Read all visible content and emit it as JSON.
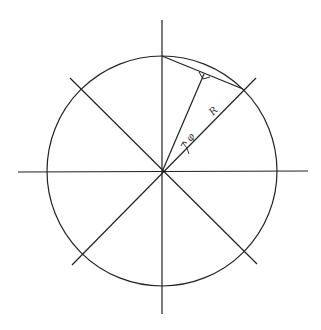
{
  "diagram": {
    "labels": {
      "radius": "R",
      "angle": "φ"
    },
    "colors": {
      "stroke": "#222222",
      "background": "#ffffff"
    },
    "geometry": {
      "center": [
        162,
        172
      ],
      "radius": 115,
      "divisions": 8
    }
  }
}
